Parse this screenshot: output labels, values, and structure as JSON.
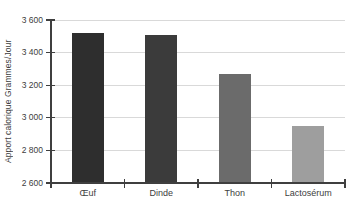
{
  "chart_data": {
    "type": "bar",
    "title": "",
    "xlabel": "",
    "ylabel": "Apport calorique Grammes/Jour",
    "categories": [
      "Œuf",
      "Dinde",
      "Thon",
      "Lactosérum"
    ],
    "values": [
      3520,
      3510,
      3270,
      2950
    ],
    "bar_colors": [
      "#2e2e2e",
      "#3b3b3b",
      "#6b6b6b",
      "#9e9e9e"
    ],
    "ylim": [
      2600,
      3600
    ],
    "ytick_step": 200,
    "yticks": [
      {
        "value": 2600,
        "label": "2 600"
      },
      {
        "value": 2800,
        "label": "2 800"
      },
      {
        "value": 3000,
        "label": "3 000"
      },
      {
        "value": 3200,
        "label": "3 200"
      },
      {
        "value": 3400,
        "label": "3 400"
      },
      {
        "value": 3600,
        "label": "3 600"
      }
    ],
    "grid": true,
    "legend": false,
    "colors": {
      "gridline": "#d9d9d9",
      "axis": "#3f3f3f",
      "text": "#404040",
      "background": "#ffffff"
    }
  }
}
